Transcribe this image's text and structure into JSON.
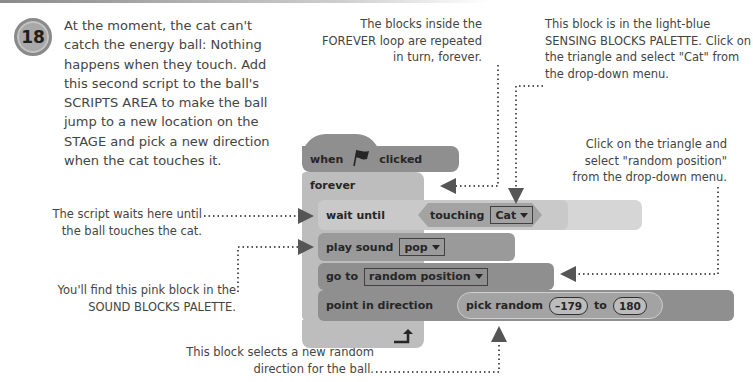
{
  "step": {
    "number": "18",
    "text": "At the moment, the cat can't catch the energy ball: Nothing happens when they touch. Add this second script to the ball's SCRIPTS AREA to make the ball jump to a new location on the STAGE and pick a new direction when the cat touches it."
  },
  "annotations": {
    "forever_loop": "The blocks inside the FOREVER loop are repeated in turn, forever.",
    "sensing_block": "This block is in the light-blue SENSING BLOCKS PALETTE. Click on the triangle and select \"Cat\" from the drop-down menu.",
    "random_position": "Click on the triangle and select \"random position\" from the drop-down menu.",
    "wait_until": "The script waits here until the ball touches the cat.",
    "sound_block": "You'll find this pink block in the SOUND BLOCKS PALETTE.",
    "random_direction": "This block selects a new random direction for the ball."
  },
  "script": {
    "hat": {
      "when": "when",
      "flag_icon": "green-flag-icon",
      "clicked": "clicked"
    },
    "forever": "forever",
    "wait_until": "wait until",
    "touching": "touching",
    "touching_target": "Cat",
    "touching_q": "?",
    "play_sound": "play sound",
    "sound_name": "pop",
    "go_to": "go to",
    "go_to_target": "random position",
    "point_in_direction": "point in direction",
    "pick_random": "pick random",
    "pick_from": "–179",
    "pick_to_label": "to",
    "pick_to": "180"
  }
}
